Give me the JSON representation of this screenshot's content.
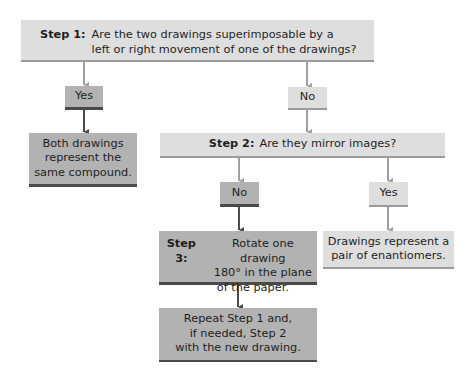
{
  "flowchart": {
    "step1": {
      "label": "Step 1:",
      "line1": "Are the two drawings superimposable by a",
      "line2": "left or right movement of one of the drawings?"
    },
    "step1_yes": "Yes",
    "step1_no": "No",
    "same_compound": [
      "Both drawings",
      "represent the",
      "same compound."
    ],
    "step2": {
      "label": "Step 2:",
      "text": "Are they mirror images?"
    },
    "step2_no": "No",
    "step2_yes": "Yes",
    "step3": {
      "label": "Step 3:",
      "line1": "Rotate one drawing",
      "line2": "180° in the plane",
      "line3": "of the paper."
    },
    "enantiomers": [
      "Drawings represent a",
      "pair of enantiomers."
    ],
    "repeat": [
      "Repeat Step 1 and,",
      "if needed, Step 2",
      "with the new drawing."
    ]
  },
  "colors": {
    "light_box": "#dedede",
    "dark_box": "#b2b2b2",
    "dark_arrow": "#4a4a4a",
    "light_arrow": "#a0a0a0"
  }
}
